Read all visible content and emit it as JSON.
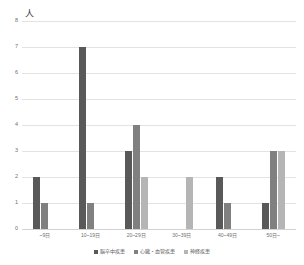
{
  "chart_data": {
    "type": "bar",
    "title": "",
    "subtitle": "",
    "xlabel": "",
    "ylabel": "",
    "unit_label": "人",
    "categories": [
      "~9日",
      "10~19日",
      "20~29日",
      "30~39日",
      "40~49日",
      "50日~"
    ],
    "series": [
      {
        "name": "脳卒中疾患",
        "color": "#595959",
        "values": [
          2,
          7,
          3,
          0,
          2,
          1
        ]
      },
      {
        "name": "心臓・血管疾患",
        "color": "#808080",
        "values": [
          1,
          1,
          4,
          0,
          1,
          3
        ]
      },
      {
        "name": "神経疾患",
        "color": "#b5b5b5",
        "values": [
          0,
          0,
          2,
          2,
          0,
          3
        ]
      }
    ],
    "ylim": [
      0,
      8
    ],
    "yticks": [
      "0",
      "1",
      "2",
      "3",
      "4",
      "5",
      "6",
      "7",
      "8"
    ],
    "grid": true,
    "legend_position": "bottom"
  }
}
